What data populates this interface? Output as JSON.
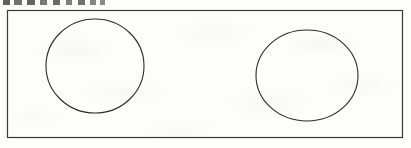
{
  "document": {
    "type": "scanned-figure",
    "page_background": "#fdfdfc",
    "clipped_header_text": ""
  },
  "figure": {
    "name": "rectangle-with-two-circles",
    "stroke_color": "#2b2b2b",
    "rect_stroke_color": "#3a3a3a",
    "fill": "none",
    "border": {
      "x": 7,
      "y": 10,
      "width": 396,
      "height": 128
    },
    "shapes": [
      {
        "name": "left-circle",
        "type": "ellipse",
        "cx": 95,
        "cy": 66,
        "rx": 49,
        "ry": 47
      },
      {
        "name": "right-circle",
        "type": "ellipse",
        "cx": 307,
        "cy": 75.5,
        "rx": 51,
        "ry": 45.5
      }
    ]
  }
}
